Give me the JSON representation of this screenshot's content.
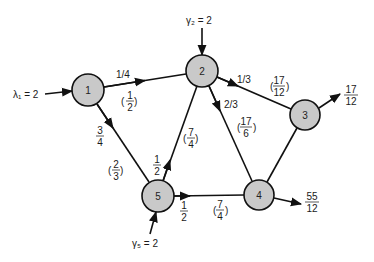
{
  "diagram": {
    "type": "queueing-network",
    "node_fill": "#c9c9c9",
    "stroke": "#111111",
    "nodes": [
      {
        "id": "1",
        "label": "1",
        "cx": 88,
        "cy": 90,
        "r": 16
      },
      {
        "id": "2",
        "label": "2",
        "cx": 202,
        "cy": 71,
        "r": 16
      },
      {
        "id": "3",
        "label": "3",
        "cx": 305,
        "cy": 115,
        "r": 15
      },
      {
        "id": "4",
        "label": "4",
        "cx": 259,
        "cy": 195,
        "r": 15
      },
      {
        "id": "5",
        "label": "5",
        "cx": 158,
        "cy": 196,
        "r": 16
      }
    ],
    "external_inputs": [
      {
        "node": "1",
        "label": "λ₁ = 2"
      },
      {
        "node": "2",
        "label": "γ₂ = 2"
      },
      {
        "node": "5",
        "label": "γ₅ = 2"
      }
    ],
    "edges": [
      {
        "from": "1",
        "to": "2",
        "prob": "1/4",
        "flow": {
          "num": "1",
          "den": "2"
        }
      },
      {
        "from": "1",
        "to": "5",
        "prob": {
          "num": "3",
          "den": "4"
        },
        "flow": {
          "num": "2",
          "den": "3"
        }
      },
      {
        "from": "5",
        "to": "2",
        "prob": {
          "num": "1",
          "den": "2"
        },
        "flow": {
          "num": "7",
          "den": "4"
        }
      },
      {
        "from": "2",
        "to": "3",
        "prob": "1/3",
        "flow": {
          "num": "17",
          "den": "12"
        }
      },
      {
        "from": "2",
        "to": "4",
        "prob": "2/3",
        "flow": {
          "num": "17",
          "den": "6"
        }
      },
      {
        "from": "5",
        "to": "4",
        "prob": {
          "num": "1",
          "den": "2"
        },
        "flow": {
          "num": "7",
          "den": "4"
        }
      },
      {
        "from": "3",
        "to": "4",
        "prob": null,
        "flow": null
      }
    ],
    "outputs": [
      {
        "node": "3",
        "value": {
          "num": "17",
          "den": "12"
        }
      },
      {
        "node": "4",
        "value": {
          "num": "55",
          "den": "12"
        }
      }
    ]
  }
}
